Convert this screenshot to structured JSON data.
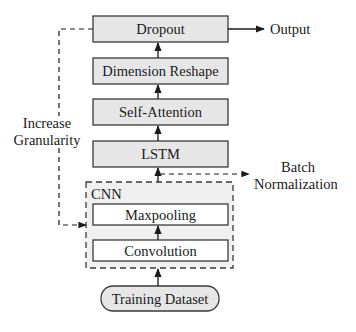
{
  "diagram": {
    "colors": {
      "stroke": "#3a3a3a",
      "block_fill": "#e6e6e6",
      "cnn_fill": "#f0f0f0",
      "inner_fill": "#ffffff"
    },
    "nodes": {
      "dropout": "Dropout",
      "dimension_reshape": "Dimension Reshape",
      "self_attention": "Self-Attention",
      "lstm": "LSTM",
      "cnn_group": "CNN",
      "maxpooling": "Maxpooling",
      "convolution": "Convolution",
      "training_dataset": "Training Dataset"
    },
    "labels": {
      "output": "Output",
      "increase_line1": "Increase",
      "increase_line2": "Granularity",
      "batch_line1": "Batch",
      "batch_line2": "Normalization"
    },
    "edges": [
      {
        "from": "Training Dataset",
        "to": "CNN",
        "style": "solid"
      },
      {
        "from": "Convolution",
        "to": "Maxpooling",
        "style": "solid"
      },
      {
        "from": "CNN",
        "to": "LSTM",
        "style": "solid"
      },
      {
        "from": "CNN",
        "to": "Batch Normalization",
        "style": "dashed"
      },
      {
        "from": "LSTM",
        "to": "Self-Attention",
        "style": "solid"
      },
      {
        "from": "Self-Attention",
        "to": "Dimension Reshape",
        "style": "solid"
      },
      {
        "from": "Dimension Reshape",
        "to": "Dropout",
        "style": "solid"
      },
      {
        "from": "Dropout",
        "to": "Output",
        "style": "solid"
      },
      {
        "from": "Dropout",
        "to": "CNN",
        "style": "dashed",
        "label": "Increase Granularity"
      }
    ]
  }
}
